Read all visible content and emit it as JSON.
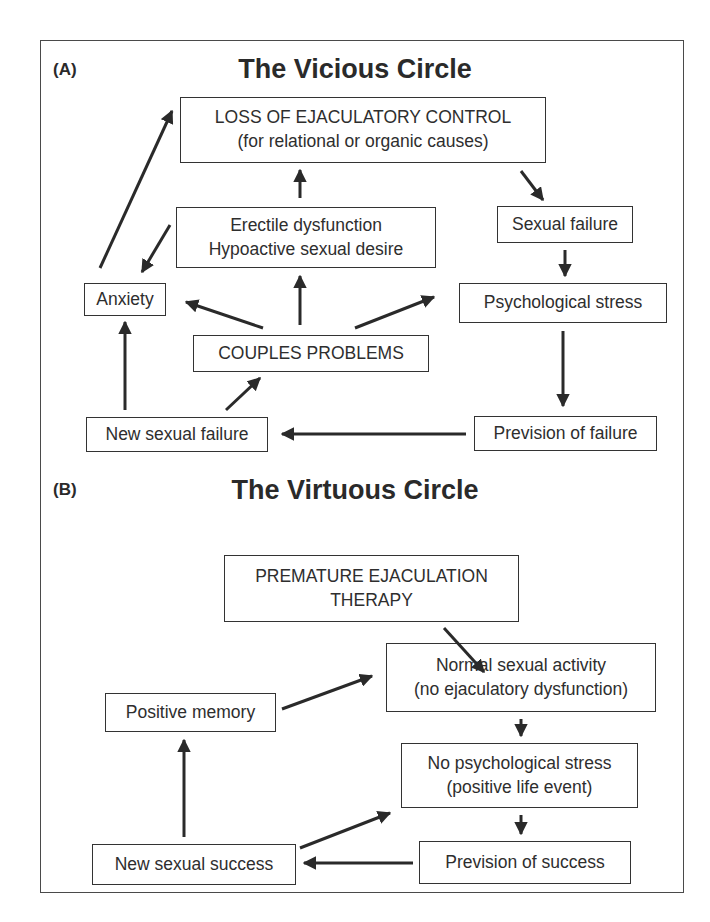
{
  "panel_a": {
    "label": "(A)",
    "title": "The Vicious Circle",
    "nodes": {
      "loss_control": [
        "LOSS OF EJACULATORY CONTROL",
        "(for relational or organic causes)"
      ],
      "erectile": [
        "Erectile dysfunction",
        "Hypoactive sexual desire"
      ],
      "sexual_failure": "Sexual failure",
      "anxiety": "Anxiety",
      "psych_stress": "Psychological stress",
      "couples": "COUPLES PROBLEMS",
      "new_failure": "New sexual failure",
      "prevision_failure": "Prevision of failure"
    }
  },
  "panel_b": {
    "label": "(B)",
    "title": "The Virtuous Circle",
    "nodes": {
      "therapy": [
        "PREMATURE EJACULATION",
        "THERAPY"
      ],
      "normal_activity": [
        "Normal sexual activity",
        "(no ejaculatory dysfunction)"
      ],
      "positive_memory": "Positive memory",
      "no_stress": [
        "No psychological stress",
        "(positive life event)"
      ],
      "new_success": "New sexual success",
      "prevision_success": "Prevision of success"
    }
  },
  "colors": {
    "line": "#2a2a2a",
    "border": "#333333",
    "background": "#ffffff"
  }
}
